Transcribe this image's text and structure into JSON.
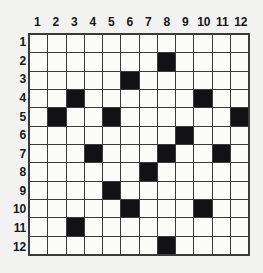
{
  "puzzle": {
    "title": "12x12 grid puzzle",
    "grid": {
      "columns": 12,
      "rows": 12,
      "column_labels": [
        "1",
        "2",
        "3",
        "4",
        "5",
        "6",
        "7",
        "8",
        "9",
        "10",
        "11",
        "12"
      ],
      "row_labels": [
        "1",
        "2",
        "3",
        "4",
        "5",
        "6",
        "7",
        "8",
        "9",
        "10",
        "11",
        "12"
      ],
      "filled_color": "#121214",
      "empty_color": "#fbfbf9",
      "border_color": "#3a3a3c",
      "background_color": "#f2f2f0",
      "filled_cells": [
        {
          "row": 2,
          "col": 8
        },
        {
          "row": 3,
          "col": 6
        },
        {
          "row": 4,
          "col": 3
        },
        {
          "row": 4,
          "col": 10
        },
        {
          "row": 5,
          "col": 2
        },
        {
          "row": 5,
          "col": 5
        },
        {
          "row": 5,
          "col": 12
        },
        {
          "row": 6,
          "col": 9
        },
        {
          "row": 7,
          "col": 4
        },
        {
          "row": 7,
          "col": 8
        },
        {
          "row": 7,
          "col": 11
        },
        {
          "row": 8,
          "col": 7
        },
        {
          "row": 9,
          "col": 5
        },
        {
          "row": 10,
          "col": 6
        },
        {
          "row": 10,
          "col": 10
        },
        {
          "row": 11,
          "col": 3
        },
        {
          "row": 12,
          "col": 8
        }
      ],
      "rows_filled": [
        [],
        [
          8
        ],
        [
          6
        ],
        [
          3,
          10
        ],
        [
          2,
          5,
          12
        ],
        [
          9
        ],
        [
          4,
          8,
          11
        ],
        [
          7
        ],
        [
          5
        ],
        [
          6,
          10
        ],
        [
          3
        ],
        [
          8
        ]
      ]
    }
  }
}
